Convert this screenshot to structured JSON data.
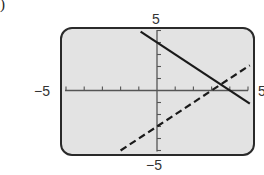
{
  "panel": {
    "label": ")"
  },
  "chart_data": {
    "type": "line",
    "title": "",
    "xlabel": "",
    "ylabel": "",
    "xlim": [
      -5,
      5
    ],
    "ylim": [
      -5,
      5
    ],
    "x_tick_step": 1,
    "y_tick_step": 1,
    "grid": false,
    "axis_labels": {
      "xmin": "−5",
      "xmax": "5",
      "ymin": "−5",
      "ymax": "5"
    },
    "series": [
      {
        "name": "y = -x + 4",
        "style": "solid",
        "color": "#1a1a1a",
        "slope": -1,
        "intercept": 4,
        "points": [
          [
            -0.9,
            4.9
          ],
          [
            5.1,
            -1.1
          ]
        ]
      },
      {
        "name": "y = x - 3",
        "style": "dashed",
        "color": "#1a1a1a",
        "slope": 1,
        "intercept": -3,
        "points": [
          [
            -2.0,
            -5.0
          ],
          [
            5.1,
            2.1
          ]
        ]
      }
    ],
    "intersection": [
      3.5,
      0.5
    ],
    "background": "#e6e6e6",
    "frame_color": "#2a2a2a"
  }
}
